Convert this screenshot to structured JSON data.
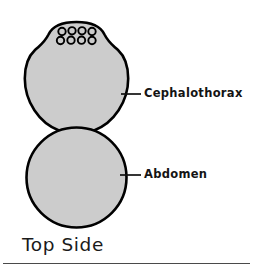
{
  "figure": {
    "caption": "Top Side",
    "background_color": "#ffffff"
  },
  "diagram": {
    "type": "anatomical-line-drawing",
    "view": "dorsal",
    "body_fill_color": "#cccccc",
    "outline_color": "#000000",
    "outline_width_px": 2.6,
    "parts": [
      {
        "id": "cephalothorax",
        "label": "Cephalothorax",
        "shape": "rounded-body-with-head-bump",
        "bounds": {
          "x": 25,
          "y": 22,
          "width": 103,
          "height": 111
        },
        "leader_line": {
          "x1": 122,
          "y1": 94,
          "x2": 141,
          "y2": 94
        },
        "label_position": {
          "x": 144,
          "y": 88
        }
      },
      {
        "id": "abdomen",
        "label": "Abdomen",
        "shape": "circle",
        "bounds": {
          "x": 26,
          "y": 127,
          "width": 101,
          "height": 101
        },
        "leader_line": {
          "x1": 120,
          "y1": 175,
          "x2": 141,
          "y2": 175
        },
        "label_position": {
          "x": 144,
          "y": 169
        }
      }
    ],
    "eyes": {
      "count": 8,
      "arrangement": "two rows of four",
      "fill_color": "#cccccc",
      "outline_color": "#000000",
      "radius_px": 3.6,
      "rows": [
        {
          "row": 1,
          "cy": 31,
          "cx_values": [
            62,
            72,
            82,
            92
          ]
        },
        {
          "row": 2,
          "cy": 40,
          "cx_values": [
            61,
            71,
            81,
            91
          ]
        }
      ]
    }
  },
  "footer": {
    "rule_color": "#4a4a4a"
  }
}
